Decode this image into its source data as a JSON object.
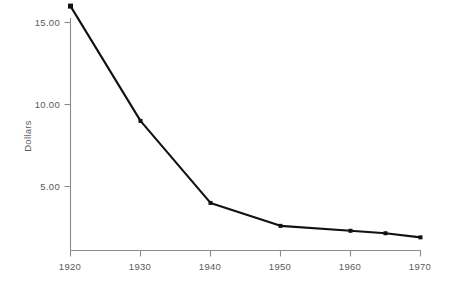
{
  "chart_data": {
    "type": "line",
    "title": "",
    "subtitle": "",
    "xlabel": "",
    "ylabel": "Dollars",
    "x": [
      1920,
      1930,
      1940,
      1950,
      1960,
      1965,
      1970
    ],
    "values": [
      16.0,
      9.0,
      4.0,
      2.6,
      2.3,
      2.15,
      1.9
    ],
    "series": [
      {
        "name": "Dollars",
        "values": [
          16.0,
          9.0,
          4.0,
          2.6,
          2.3,
          2.15,
          1.9
        ]
      }
    ],
    "x_tick_labels": [
      "1920",
      "1930",
      "1940",
      "1950",
      "1960",
      "1970"
    ],
    "x_tick_values": [
      1920,
      1930,
      1940,
      1950,
      1960,
      1970
    ],
    "y_tick_labels": [
      "5.00",
      "10.00",
      "15.00"
    ],
    "y_tick_values": [
      5.0,
      10.0,
      15.0
    ],
    "xlim": [
      1920,
      1970
    ],
    "ylim": [
      0,
      16.6
    ],
    "grid": false,
    "legend": "none",
    "markers": true,
    "line_color": "#111111",
    "axis_color": "#8a8a8a",
    "text_color": "#5a5a5a",
    "background_color": "#ffffff"
  }
}
